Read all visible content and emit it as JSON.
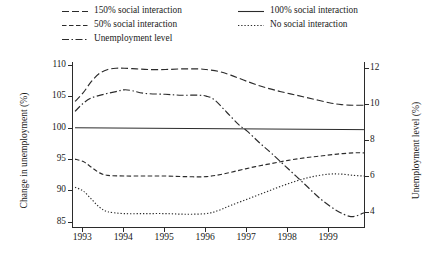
{
  "chart_data": {
    "type": "line",
    "title": "",
    "xlabel": "",
    "ylabel": "Change in unemployment (%)",
    "y2label": "Unemployment level (%)",
    "grid": false,
    "legend_position": "top",
    "xlim": [
      1992.75,
      1999.9
    ],
    "ylim": [
      84,
      110.5
    ],
    "y2lim": [
      3.1,
      12.35
    ],
    "xticks": [
      "1993",
      "1994",
      "1995",
      "1996",
      "1997",
      "1998",
      "1999"
    ],
    "xtick_values": [
      1993,
      1994,
      1995,
      1996,
      1997,
      1998,
      1999
    ],
    "yticks": [
      "85",
      "90",
      "95",
      "100",
      "105",
      "110"
    ],
    "ytick_values": [
      85,
      90,
      95,
      100,
      105,
      110
    ],
    "y2ticks": [
      "4",
      "6",
      "8",
      "10",
      "12"
    ],
    "y2tick_values": [
      4,
      6,
      8,
      10,
      12
    ],
    "series": [
      {
        "name": "150% social interaction",
        "style": "long-dash",
        "axis": "left",
        "dasharray": "7,3",
        "x": [
          1992.8,
          1993.0,
          1993.2,
          1993.4,
          1993.6,
          1993.8,
          1994.0,
          1994.3,
          1994.6,
          1995.0,
          1995.4,
          1995.8,
          1996.0,
          1996.3,
          1996.6,
          1997.0,
          1997.4,
          1997.8,
          1998.2,
          1998.6,
          1999.0,
          1999.3,
          1999.6,
          1999.85
        ],
        "y": [
          104.2,
          105.6,
          107.4,
          108.7,
          109.3,
          109.5,
          109.5,
          109.4,
          109.3,
          109.3,
          109.4,
          109.4,
          109.3,
          109.0,
          108.4,
          107.4,
          106.5,
          105.8,
          105.2,
          104.6,
          104.0,
          103.7,
          103.6,
          103.6
        ]
      },
      {
        "name": "100% social interaction",
        "style": "solid",
        "axis": "left",
        "dasharray": "",
        "x": [
          1992.8,
          1999.85
        ],
        "y": [
          100.0,
          99.7
        ]
      },
      {
        "name": "50% social interaction",
        "style": "medium-dash",
        "axis": "left",
        "dasharray": "4.5,2.5",
        "x": [
          1992.8,
          1993.0,
          1993.2,
          1993.4,
          1993.6,
          1994.0,
          1994.5,
          1995.0,
          1995.5,
          1996.0,
          1996.4,
          1996.8,
          1997.2,
          1997.6,
          1998.0,
          1998.4,
          1998.8,
          1999.2,
          1999.6,
          1999.85
        ],
        "y": [
          95.0,
          94.6,
          93.7,
          92.8,
          92.4,
          92.3,
          92.3,
          92.3,
          92.2,
          92.2,
          92.6,
          93.2,
          93.8,
          94.3,
          94.8,
          95.2,
          95.5,
          95.8,
          96.0,
          96.0
        ]
      },
      {
        "name": "No social interaction",
        "style": "dotted",
        "axis": "left",
        "dasharray": "1.3,1.9",
        "x": [
          1992.8,
          1993.0,
          1993.2,
          1993.4,
          1993.6,
          1994.0,
          1994.5,
          1995.0,
          1995.5,
          1996.0,
          1996.3,
          1996.6,
          1997.0,
          1997.4,
          1997.8,
          1998.2,
          1998.6,
          1999.0,
          1999.3,
          1999.6,
          1999.85
        ],
        "y": [
          90.5,
          89.9,
          88.6,
          87.3,
          86.6,
          86.3,
          86.3,
          86.3,
          86.2,
          86.3,
          86.8,
          87.6,
          88.6,
          89.6,
          90.6,
          91.5,
          92.2,
          92.6,
          92.6,
          92.4,
          92.3
        ]
      },
      {
        "name": "Unemployment level",
        "style": "dash-dot",
        "axis": "right",
        "dasharray": "7,2.5,1.5,2.5",
        "x": [
          1992.8,
          1993.0,
          1993.2,
          1993.5,
          1993.8,
          1994.0,
          1994.2,
          1994.5,
          1995.0,
          1995.4,
          1995.8,
          1996.0,
          1996.2,
          1996.5,
          1996.8,
          1997.0,
          1997.3,
          1997.6,
          1998.0,
          1998.4,
          1998.8,
          1999.2,
          1999.5,
          1999.7,
          1999.85
        ],
        "y_level": [
          9.6,
          10.05,
          10.35,
          10.55,
          10.7,
          10.8,
          10.75,
          10.6,
          10.55,
          10.5,
          10.5,
          10.45,
          10.25,
          9.55,
          8.85,
          8.5,
          7.85,
          7.25,
          6.4,
          5.55,
          4.7,
          4.05,
          3.75,
          3.8,
          3.95
        ]
      }
    ]
  },
  "legend": {
    "items": [
      {
        "label": "150% social interaction",
        "style": "long-dash"
      },
      {
        "label": "50% social interaction",
        "style": "medium-dash"
      },
      {
        "label": "Unemployment level",
        "style": "dash-dot"
      },
      {
        "label": "100% social interaction",
        "style": "solid"
      },
      {
        "label": "No social interaction",
        "style": "dotted"
      }
    ]
  },
  "colors": {
    "line": "#2b2b2b",
    "axis": "#2b2b2b",
    "background": "#ffffff"
  }
}
